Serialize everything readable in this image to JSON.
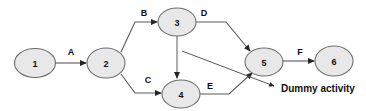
{
  "diagram": {
    "type": "network-diagram",
    "background_color": "#ffffff",
    "node_fill_color": "#e8e8e8",
    "node_stroke_color": "#6f6f6f",
    "edge_color": "#5a5a5a",
    "text_color": "#111111",
    "nodes": [
      {
        "id": "1",
        "label": "1",
        "cx": 35,
        "cy": 63,
        "rx": 20.5,
        "ry": 14.5
      },
      {
        "id": "2",
        "label": "2",
        "cx": 106,
        "cy": 63,
        "rx": 19.0,
        "ry": 15.0
      },
      {
        "id": "3",
        "label": "3",
        "cx": 177,
        "cy": 22,
        "rx": 19.0,
        "ry": 14.0
      },
      {
        "id": "4",
        "label": "4",
        "cx": 181,
        "cy": 94,
        "rx": 19.0,
        "ry": 14.0
      },
      {
        "id": "5",
        "label": "5",
        "cx": 264,
        "cy": 62,
        "rx": 19.0,
        "ry": 14.0
      },
      {
        "id": "6",
        "label": "6",
        "cx": 334,
        "cy": 61,
        "rx": 19.0,
        "ry": 15.0
      }
    ],
    "edges": [
      {
        "id": "A",
        "label": "A",
        "from": "1",
        "to": "2",
        "label_x": 71,
        "label_y": 52,
        "path": "M 56 63 L 86 63",
        "arrow": true
      },
      {
        "id": "B",
        "label": "B",
        "from": "2",
        "to": "3",
        "label_x": 144,
        "label_y": 13,
        "path": "M 121 52 L 135 22 L 157 22",
        "arrow": true
      },
      {
        "id": "C",
        "label": "C",
        "from": "2",
        "to": "4",
        "label_x": 148,
        "label_y": 80,
        "path": "M 121 74 L 135 93 L 161 93",
        "arrow": true
      },
      {
        "id": "D",
        "label": "D",
        "from": "3",
        "to": "5",
        "label_x": 204,
        "label_y": 13,
        "path": "M 196 22 L 226 22 L 250 51",
        "arrow": true
      },
      {
        "id": "E",
        "label": "E",
        "from": "4",
        "to": "5",
        "label_x": 210,
        "label_y": 86,
        "path": "M 200 94 L 229 94 L 252 73",
        "arrow": true
      },
      {
        "id": "F",
        "label": "F",
        "from": "5",
        "to": "6",
        "label_x": 300,
        "label_y": 52,
        "path": "M 283 61 L 314 61",
        "arrow": true
      },
      {
        "id": "dummy",
        "label": "",
        "from": "3",
        "to": "4",
        "label_x": 0,
        "label_y": 0,
        "path": "M 177 36 L 177 78",
        "arrow": true
      }
    ],
    "annotation": {
      "text": "Dummy activity",
      "text_x": 281,
      "text_y": 88,
      "pointer_path": "M 182 51 L 274 86",
      "pointer_arrow": true
    }
  }
}
